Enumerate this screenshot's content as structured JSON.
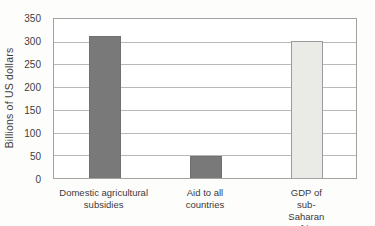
{
  "chart_data": {
    "type": "bar",
    "title": "",
    "xlabel": "",
    "ylabel": "Billions of US dollars",
    "categories": [
      "Domestic agricultural\nsubsidies",
      "Aid to all\ncountries",
      "GDP of sub-Saharan\nAfrica"
    ],
    "values": [
      312,
      48,
      302
    ],
    "bar_colors": [
      "#797979",
      "#797979",
      "#eaeae7"
    ],
    "bar_border_colors": [
      "#707070",
      "#707070",
      "#9b9b9b"
    ],
    "ylim": [
      0,
      350
    ],
    "yticks": [
      0,
      50,
      100,
      150,
      200,
      250,
      300,
      350
    ],
    "grid": true,
    "legend": false
  },
  "colors": {
    "gridline": "#b8b8b8",
    "frame": "#a3a3a3",
    "text": "#3d3d3d",
    "background": "#fdfdfc"
  }
}
